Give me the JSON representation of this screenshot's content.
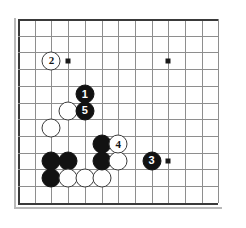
{
  "figure": {
    "name": "go-board-diagram",
    "type": "go-game-diagram",
    "board_size_visible": {
      "columns": 13,
      "rows": 12
    },
    "geometry": {
      "origin_x": 18,
      "origin_y": 19,
      "cell": 16.7,
      "stone_diameter": 19
    },
    "colors": {
      "board_background": "#ffffff",
      "grid_line": "#8e8e8e",
      "border_line": "#3a3a3a",
      "black_stone": "#121212",
      "white_stone": "#ffffff",
      "black_label_text": "#ffffff",
      "white_label_text": "#141414",
      "star_point": "#1a1a1a"
    },
    "star_points": [
      {
        "name": "star-point-upper-left",
        "col": 3,
        "row": 2.5
      },
      {
        "name": "star-point-upper-right",
        "col": 9,
        "row": 2.5
      },
      {
        "name": "star-point-lower-right",
        "col": 9,
        "row": 8.5
      }
    ],
    "stones": [
      {
        "name": "white-stone-plain-a",
        "color": "white",
        "label": "",
        "col": 2,
        "row": 6.5
      },
      {
        "name": "white-stone-plain-b",
        "color": "white",
        "label": "",
        "col": 3,
        "row": 5.5
      },
      {
        "name": "black-stone-plain-a",
        "color": "black",
        "label": "",
        "col": 2,
        "row": 8.5
      },
      {
        "name": "black-stone-plain-b",
        "color": "black",
        "label": "",
        "col": 3,
        "row": 8.5
      },
      {
        "name": "black-stone-plain-c",
        "color": "black",
        "label": "",
        "col": 2,
        "row": 9.5
      },
      {
        "name": "white-stone-plain-c",
        "color": "white",
        "label": "",
        "col": 3,
        "row": 9.5
      },
      {
        "name": "white-stone-plain-d",
        "color": "white",
        "label": "",
        "col": 4,
        "row": 9.5
      },
      {
        "name": "white-stone-plain-e",
        "color": "white",
        "label": "",
        "col": 5,
        "row": 9.5
      },
      {
        "name": "black-stone-plain-d",
        "color": "black",
        "label": "",
        "col": 5,
        "row": 7.5
      },
      {
        "name": "black-stone-plain-e",
        "color": "black",
        "label": "",
        "col": 5,
        "row": 8.5
      },
      {
        "name": "white-stone-plain-f",
        "color": "white",
        "label": "",
        "col": 6,
        "row": 8.5
      },
      {
        "name": "move-stone-1",
        "color": "black",
        "label": "1",
        "col": 4,
        "row": 4.5
      },
      {
        "name": "move-stone-2",
        "color": "white",
        "label": "2",
        "col": 2,
        "row": 2.5
      },
      {
        "name": "move-stone-3",
        "color": "black",
        "label": "3",
        "col": 8,
        "row": 8.5
      },
      {
        "name": "move-stone-4",
        "color": "white",
        "label": "4",
        "col": 6,
        "row": 7.5
      },
      {
        "name": "move-stone-5",
        "color": "black",
        "label": "5",
        "col": 4,
        "row": 5.5
      }
    ]
  }
}
